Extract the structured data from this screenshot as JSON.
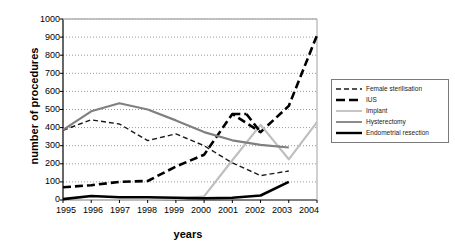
{
  "chart_data": {
    "type": "line",
    "title": "",
    "xlabel": "years",
    "ylabel": "number of procedures",
    "x": [
      1995,
      1996,
      1997,
      1998,
      1999,
      2000,
      2001,
      2002,
      2003,
      2004
    ],
    "xtick_labels": [
      "1995",
      "1996",
      "1997",
      "1998",
      "1999",
      "2000",
      "2001",
      "2002",
      "2003",
      "2004"
    ],
    "ytick_labels": [
      "0",
      "100",
      "200",
      "300",
      "400",
      "500",
      "600",
      "700",
      "800",
      "900",
      "1000"
    ],
    "ylim": [
      0,
      1000
    ],
    "ytick_step": 100,
    "grid": "horizontal-dotted",
    "legend_position": "right-outside",
    "series": [
      {
        "name": "Female sterilisation",
        "style": "dashed",
        "color": "#1a1a1a",
        "width": 1.4,
        "values": [
          385,
          443,
          420,
          328,
          365,
          300,
          205,
          135,
          160,
          null
        ]
      },
      {
        "name": "IUS",
        "style": "long-dashed",
        "color": "#000000",
        "width": 2.6,
        "values": [
          70,
          82,
          100,
          105,
          185,
          250,
          475,
          375,
          520,
          910
        ]
      },
      {
        "name": "Implant",
        "style": "solid",
        "color": "#bfbfbf",
        "width": 2.2,
        "values": [
          0,
          0,
          0,
          0,
          5,
          20,
          220,
          415,
          225,
          430
        ]
      },
      {
        "name": "Hysterectomy",
        "style": "solid",
        "color": "#808080",
        "width": 2.2,
        "values": [
          388,
          490,
          535,
          500,
          440,
          375,
          330,
          305,
          290,
          null
        ]
      },
      {
        "name": "Endometrial resection",
        "style": "solid",
        "color": "#000000",
        "width": 2.6,
        "values": [
          5,
          22,
          15,
          15,
          12,
          10,
          12,
          25,
          100,
          null
        ]
      }
    ],
    "annotations": {
      "ius_midpoint_2001_peak": 475,
      "ius_2002_dip": 375
    }
  },
  "legend": {
    "items": [
      {
        "label": "Female sterilisation"
      },
      {
        "label": "IUS"
      },
      {
        "label": "Implant"
      },
      {
        "label": "Hysterectomy"
      },
      {
        "label": "Endometrial resection"
      }
    ]
  }
}
